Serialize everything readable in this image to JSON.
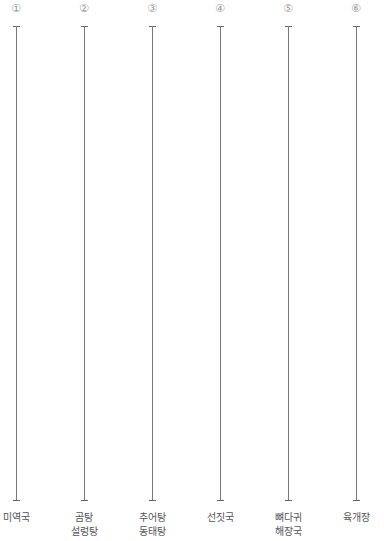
{
  "columns": [
    {
      "number": "①",
      "label": "미역국",
      "x": 16
    },
    {
      "number": "②",
      "label": "곰탕\n설렁탕",
      "x": 84
    },
    {
      "number": "③",
      "label": "추어탕\n동태탕",
      "x": 152
    },
    {
      "number": "④",
      "label": "선짓국",
      "x": 220
    },
    {
      "number": "⑤",
      "label": "뼈다귀\n해장국",
      "x": 288
    },
    {
      "number": "⑥",
      "label": "육개장",
      "x": 356
    }
  ]
}
